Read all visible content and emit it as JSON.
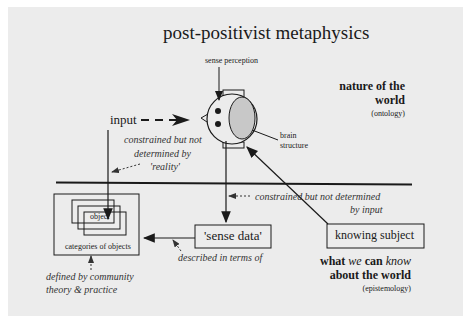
{
  "diagram": {
    "title": "post-positivist metaphysics",
    "labels": {
      "sense_perception": "sense perception",
      "input": "input",
      "brain_structure_1": "brain",
      "brain_structure_2": "structure",
      "constrained_reality_1": "constrained but not",
      "constrained_reality_2": "determined by",
      "constrained_reality_3": "'reality'",
      "constrained_input_1": "constrained but not determined",
      "constrained_input_2": "by input",
      "described_in_terms_of": "described in terms of",
      "defined_by_1": "defined by community",
      "defined_by_2": "theory & practice"
    },
    "boxes": {
      "object": "object",
      "categories": "categories of objects",
      "sense_data": "'sense data'",
      "knowing_subject": "knowing subject"
    },
    "ontology": {
      "line1": "nature of the",
      "line2": "world",
      "sub": "(ontology)"
    },
    "epistemology": {
      "line1_a": "what ",
      "line1_we": "we",
      "line1_b": " can ",
      "line1_know": "know",
      "line2": "about the world",
      "sub": "(epistemology)"
    },
    "colors": {
      "background": "#ececec",
      "ink": "#1a1a1a",
      "brain_fill": "#c8c8c8"
    }
  }
}
